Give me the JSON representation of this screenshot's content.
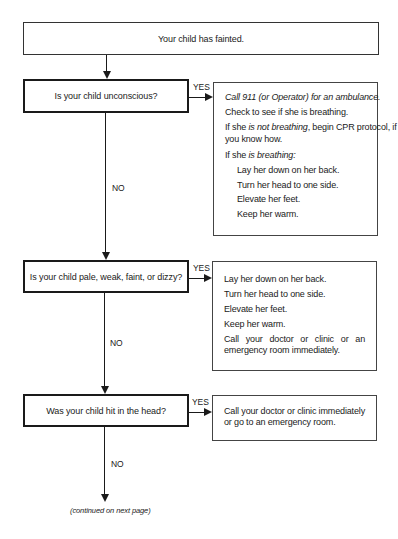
{
  "start": {
    "text": "Your child has fainted."
  },
  "labels": {
    "yes": "YES",
    "no": "NO"
  },
  "steps": [
    {
      "question": "Is your child unconscious?",
      "answer": {
        "call_line": "Call 911 (or Operator) for an ambulance.",
        "check_line": "Check to see if she is breathing.",
        "not_breathing_prefix": "If she ",
        "not_breathing_italic": "is not breathing",
        "not_breathing_suffix": ", begin CPR protocol, if",
        "not_breathing_cont": "you know how.",
        "breathing_prefix": "If she ",
        "breathing_italic": "is breathing:",
        "sub_items": [
          "Lay her down on her back.",
          "Turn her head to one side.",
          "Elevate her feet.",
          "Keep her warm."
        ]
      }
    },
    {
      "question": "Is your child pale, weak, faint, or dizzy?",
      "answer": {
        "items": [
          "Lay her down on her back.",
          "Turn her head to one side.",
          "Elevate her feet.",
          "Keep her warm."
        ],
        "last": "Call your doctor or clinic or an emergency room immediately."
      }
    },
    {
      "question": "Was your child hit in the head?",
      "answer": {
        "text": "Call your doctor or clinic immediately or go to an emergency room."
      }
    }
  ],
  "footer": {
    "continued": "(continued on next page)"
  }
}
